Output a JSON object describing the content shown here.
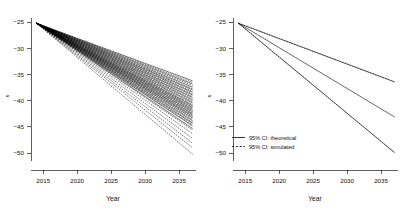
{
  "figure": {
    "title": "",
    "background": "#ffffff",
    "line_color": "#000000",
    "panels": 2
  },
  "chart_data": [
    {
      "type": "line",
      "panel": "left",
      "title": "",
      "xlabel": "Year",
      "ylabel": "κ",
      "xlim": [
        2013.2,
        2037.5
      ],
      "ylim": [
        -51.5,
        -24.2
      ],
      "xticks": [
        2015,
        2020,
        2025,
        2030,
        2035
      ],
      "yticks": [
        -25,
        -30,
        -35,
        -40,
        -45,
        -50
      ],
      "xtick_labels": [
        "2015",
        "2020",
        "2025",
        "2030",
        "2035"
      ],
      "ytick_labels": [
        "-25",
        "-30",
        "-35",
        "-40",
        "-45",
        "-50"
      ],
      "grid": false,
      "legend": null,
      "description": "Fan of many overlapping simulated and theoretical 95% CI bounds, all emanating from a common origin at (2014, -25.2) and diverging linearly.",
      "origin": {
        "x": 2014,
        "y": -25.2
      },
      "series": [
        {
          "name": "theoretical-bound-01",
          "style": "solid",
          "x": [
            2014,
            2037
          ],
          "values": [
            -25.2,
            -36.2
          ]
        },
        {
          "name": "theoretical-bound-02",
          "style": "solid",
          "x": [
            2014,
            2037
          ],
          "values": [
            -25.2,
            -36.8
          ]
        },
        {
          "name": "theoretical-bound-03",
          "style": "solid",
          "x": [
            2014,
            2037
          ],
          "values": [
            -25.2,
            -37.4
          ]
        },
        {
          "name": "theoretical-bound-04",
          "style": "solid",
          "x": [
            2014,
            2037
          ],
          "values": [
            -25.2,
            -37.9
          ]
        },
        {
          "name": "theoretical-bound-05",
          "style": "solid",
          "x": [
            2014,
            2037
          ],
          "values": [
            -25.2,
            -38.4
          ]
        },
        {
          "name": "theoretical-bound-06",
          "style": "solid",
          "x": [
            2014,
            2037
          ],
          "values": [
            -25.2,
            -38.9
          ]
        },
        {
          "name": "theoretical-bound-07",
          "style": "solid",
          "x": [
            2014,
            2037
          ],
          "values": [
            -25.2,
            -39.4
          ]
        },
        {
          "name": "theoretical-bound-08",
          "style": "solid",
          "x": [
            2014,
            2037
          ],
          "values": [
            -25.2,
            -39.9
          ]
        },
        {
          "name": "theoretical-bound-09",
          "style": "solid",
          "x": [
            2014,
            2037
          ],
          "values": [
            -25.2,
            -40.4
          ]
        },
        {
          "name": "theoretical-bound-10",
          "style": "solid",
          "x": [
            2014,
            2037
          ],
          "values": [
            -25.2,
            -40.9
          ]
        },
        {
          "name": "theoretical-bound-11",
          "style": "solid",
          "x": [
            2014,
            2037
          ],
          "values": [
            -25.2,
            -41.3
          ]
        },
        {
          "name": "theoretical-bound-12",
          "style": "solid",
          "x": [
            2014,
            2037
          ],
          "values": [
            -25.2,
            -41.7
          ]
        },
        {
          "name": "theoretical-bound-13",
          "style": "solid",
          "x": [
            2014,
            2037
          ],
          "values": [
            -25.2,
            -42.1
          ]
        },
        {
          "name": "theoretical-bound-14",
          "style": "solid",
          "x": [
            2014,
            2037
          ],
          "values": [
            -25.2,
            -42.5
          ]
        },
        {
          "name": "theoretical-bound-15",
          "style": "solid",
          "x": [
            2014,
            2037
          ],
          "values": [
            -25.2,
            -42.9
          ]
        },
        {
          "name": "theoretical-bound-16",
          "style": "solid",
          "x": [
            2014,
            2037
          ],
          "values": [
            -25.2,
            -43.3
          ]
        },
        {
          "name": "theoretical-bound-17",
          "style": "solid",
          "x": [
            2014,
            2037
          ],
          "values": [
            -25.2,
            -43.8
          ]
        },
        {
          "name": "theoretical-bound-18",
          "style": "solid",
          "x": [
            2014,
            2037
          ],
          "values": [
            -25.2,
            -44.3
          ]
        },
        {
          "name": "theoretical-bound-19",
          "style": "solid",
          "x": [
            2014,
            2037
          ],
          "values": [
            -25.2,
            -44.8
          ]
        },
        {
          "name": "theoretical-bound-20",
          "style": "solid",
          "x": [
            2014,
            2037
          ],
          "values": [
            -25.2,
            -45.3
          ]
        },
        {
          "name": "simulated-bound-01",
          "style": "dashed",
          "x": [
            2014,
            2037
          ],
          "values": [
            -25.2,
            -36.5
          ]
        },
        {
          "name": "simulated-bound-02",
          "style": "dashed",
          "x": [
            2014,
            2037
          ],
          "values": [
            -25.2,
            -37.1
          ]
        },
        {
          "name": "simulated-bound-03",
          "style": "dashed",
          "x": [
            2014,
            2037
          ],
          "values": [
            -25.2,
            -37.7
          ]
        },
        {
          "name": "simulated-bound-04",
          "style": "dashed",
          "x": [
            2014,
            2037
          ],
          "values": [
            -25.2,
            -38.2
          ]
        },
        {
          "name": "simulated-bound-05",
          "style": "dashed",
          "x": [
            2014,
            2037
          ],
          "values": [
            -25.2,
            -38.7
          ]
        },
        {
          "name": "simulated-bound-06",
          "style": "dashed",
          "x": [
            2014,
            2037
          ],
          "values": [
            -25.2,
            -39.2
          ]
        },
        {
          "name": "simulated-bound-07",
          "style": "dashed",
          "x": [
            2014,
            2037
          ],
          "values": [
            -25.2,
            -39.7
          ]
        },
        {
          "name": "simulated-bound-08",
          "style": "dashed",
          "x": [
            2014,
            2037
          ],
          "values": [
            -25.2,
            -40.2
          ]
        },
        {
          "name": "simulated-bound-09",
          "style": "dashed",
          "x": [
            2014,
            2037
          ],
          "values": [
            -25.2,
            -40.7
          ]
        },
        {
          "name": "simulated-bound-10",
          "style": "dashed",
          "x": [
            2014,
            2037
          ],
          "values": [
            -25.2,
            -41.1
          ]
        },
        {
          "name": "simulated-bound-11",
          "style": "dashed",
          "x": [
            2014,
            2037
          ],
          "values": [
            -25.2,
            -41.5
          ]
        },
        {
          "name": "simulated-bound-12",
          "style": "dashed",
          "x": [
            2014,
            2037
          ],
          "values": [
            -25.2,
            -41.9
          ]
        },
        {
          "name": "simulated-bound-13",
          "style": "dashed",
          "x": [
            2014,
            2037
          ],
          "values": [
            -25.2,
            -42.3
          ]
        },
        {
          "name": "simulated-bound-14",
          "style": "dashed",
          "x": [
            2014,
            2037
          ],
          "values": [
            -25.2,
            -42.7
          ]
        },
        {
          "name": "simulated-bound-15",
          "style": "dashed",
          "x": [
            2014,
            2037
          ],
          "values": [
            -25.2,
            -43.1
          ]
        },
        {
          "name": "simulated-bound-16",
          "style": "dashed",
          "x": [
            2014,
            2037
          ],
          "values": [
            -25.2,
            -43.6
          ]
        },
        {
          "name": "simulated-bound-17",
          "style": "dashed",
          "x": [
            2014,
            2037
          ],
          "values": [
            -25.2,
            -44.1
          ]
        },
        {
          "name": "simulated-bound-18",
          "style": "dashed",
          "x": [
            2014,
            2037
          ],
          "values": [
            -25.2,
            -44.6
          ]
        },
        {
          "name": "simulated-bound-19",
          "style": "dashed",
          "x": [
            2014,
            2037
          ],
          "values": [
            -25.2,
            -45.6
          ]
        },
        {
          "name": "simulated-bound-20",
          "style": "dashed",
          "x": [
            2014,
            2037
          ],
          "values": [
            -25.2,
            -46.3
          ]
        },
        {
          "name": "simulated-outlier-01",
          "style": "dashed",
          "x": [
            2014,
            2037
          ],
          "values": [
            -25.2,
            -47.2
          ]
        },
        {
          "name": "simulated-outlier-02",
          "style": "dashed",
          "x": [
            2014,
            2037
          ],
          "values": [
            -25.2,
            -48.1
          ]
        },
        {
          "name": "simulated-outlier-03",
          "style": "dashed",
          "x": [
            2014,
            2037
          ],
          "values": [
            -25.2,
            -49.0
          ]
        },
        {
          "name": "simulated-outlier-04",
          "style": "dashed",
          "x": [
            2014,
            2037
          ],
          "values": [
            -25.2,
            -50.2
          ]
        }
      ]
    },
    {
      "type": "line",
      "panel": "right",
      "title": "",
      "xlabel": "Year",
      "ylabel": "κ",
      "xlim": [
        2013.2,
        2037.5
      ],
      "ylim": [
        -51.5,
        -24.2
      ],
      "xticks": [
        2015,
        2020,
        2025,
        2030,
        2035
      ],
      "yticks": [
        -25,
        -30,
        -35,
        -40,
        -45,
        -50
      ],
      "xtick_labels": [
        "2015",
        "2020",
        "2025",
        "2030",
        "2035"
      ],
      "ytick_labels": [
        "-25",
        "-30",
        "-35",
        "-40",
        "-45",
        "-50"
      ],
      "grid": false,
      "description": "Mean projection with upper and lower 95% confidence bounds; theoretical bounds drawn solid, simulated bounds drawn dashed and nearly coincident with them.",
      "origin": {
        "x": 2014,
        "y": -25.2
      },
      "legend": {
        "position": "bottom-left",
        "entries": [
          {
            "label": "95% CI: theoretical",
            "style": "solid"
          },
          {
            "label": "95% CI: simulated",
            "style": "dashed"
          }
        ]
      },
      "series": [
        {
          "name": "upper-ci-theoretical",
          "style": "solid",
          "x": [
            2014,
            2037
          ],
          "values": [
            -25.2,
            -36.4
          ]
        },
        {
          "name": "upper-ci-simulated",
          "style": "dashed",
          "x": [
            2014,
            2037
          ],
          "values": [
            -25.2,
            -36.4
          ]
        },
        {
          "name": "central-projection",
          "style": "solid",
          "x": [
            2014,
            2037
          ],
          "values": [
            -25.2,
            -43.1
          ]
        },
        {
          "name": "lower-ci-theoretical",
          "style": "solid",
          "x": [
            2014,
            2037
          ],
          "values": [
            -25.2,
            -49.9
          ]
        },
        {
          "name": "lower-ci-simulated",
          "style": "dashed",
          "x": [
            2014,
            2037
          ],
          "values": [
            -25.2,
            -49.9
          ]
        }
      ]
    }
  ]
}
